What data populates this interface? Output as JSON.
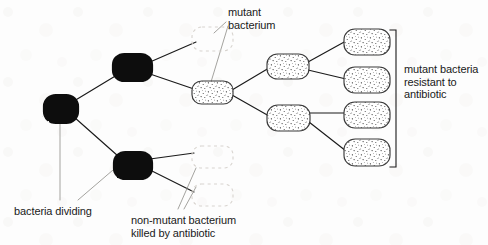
{
  "diagram": {
    "colors": {
      "ink": "#111111",
      "dead_cell_outline": "#d8d4cf",
      "stipple_outline": "#3a3a3a",
      "background": "#fdfdfd",
      "line": "#1a1a1a"
    },
    "labels": [
      {
        "id": "mutant-bacterium",
        "text": "mutant\nbacterium",
        "x": 228,
        "y": 6,
        "align": "left"
      },
      {
        "id": "mutant-bacteria-resistant",
        "text": "mutant bacteria\nresistant to\nantibiotic",
        "x": 404,
        "y": 63,
        "align": "left"
      },
      {
        "id": "bacteria-dividing",
        "text": "bacteria dividing",
        "x": 14,
        "y": 205,
        "align": "left"
      },
      {
        "id": "non-mutant-killed",
        "text": "non-mutant bacterium\nkilled by antibiotic",
        "x": 131,
        "y": 214,
        "align": "left"
      }
    ],
    "cells": [
      {
        "id": "founder-cell",
        "kind": "black",
        "x": 44,
        "y": 95,
        "w": 34,
        "h": 28
      },
      {
        "id": "gen2-upper-cell",
        "kind": "black",
        "x": 113,
        "y": 54,
        "w": 39,
        "h": 27
      },
      {
        "id": "gen2-lower-cell",
        "kind": "black",
        "x": 114,
        "y": 152,
        "w": 38,
        "h": 27
      },
      {
        "id": "gen3-dead-upper-cell",
        "kind": "dead",
        "x": 192,
        "y": 27,
        "w": 41,
        "h": 24
      },
      {
        "id": "gen3-mutant-cell",
        "kind": "stipple",
        "x": 192,
        "y": 81,
        "w": 41,
        "h": 23
      },
      {
        "id": "gen3-dead-mid-cell",
        "kind": "dead",
        "x": 192,
        "y": 146,
        "w": 41,
        "h": 22
      },
      {
        "id": "gen3-dead-lower-cell",
        "kind": "dead",
        "x": 192,
        "y": 184,
        "w": 41,
        "h": 22
      },
      {
        "id": "gen4-mutant-upper-cell",
        "kind": "stipple",
        "x": 267,
        "y": 54,
        "w": 42,
        "h": 25
      },
      {
        "id": "gen4-mutant-lower-cell",
        "kind": "stipple",
        "x": 267,
        "y": 105,
        "w": 43,
        "h": 26
      },
      {
        "id": "gen5-mutant-cell-1",
        "kind": "stipple",
        "x": 344,
        "y": 29,
        "w": 46,
        "h": 26
      },
      {
        "id": "gen5-mutant-cell-2",
        "kind": "stipple",
        "x": 344,
        "y": 67,
        "w": 46,
        "h": 26
      },
      {
        "id": "gen5-mutant-cell-3",
        "kind": "stipple",
        "x": 344,
        "y": 102,
        "w": 46,
        "h": 26
      },
      {
        "id": "gen5-mutant-cell-4",
        "kind": "stipple",
        "x": 344,
        "y": 139,
        "w": 46,
        "h": 27
      }
    ],
    "division_lines": [
      {
        "id": "founder-to-gen2-upper",
        "x1": 74,
        "y1": 101,
        "x2": 117,
        "y2": 75
      },
      {
        "id": "founder-to-gen2-lower",
        "x1": 74,
        "y1": 117,
        "x2": 118,
        "y2": 156
      },
      {
        "id": "gen2upper-to-dead",
        "x1": 150,
        "y1": 62,
        "x2": 196,
        "y2": 42
      },
      {
        "id": "gen2upper-to-mutant",
        "x1": 150,
        "y1": 74,
        "x2": 194,
        "y2": 89
      },
      {
        "id": "gen2lower-to-dead-mid",
        "x1": 150,
        "y1": 159,
        "x2": 194,
        "y2": 153
      },
      {
        "id": "gen2lower-to-dead-low",
        "x1": 150,
        "y1": 170,
        "x2": 194,
        "y2": 192
      },
      {
        "id": "mutant-to-gen4-upper",
        "x1": 232,
        "y1": 90,
        "x2": 269,
        "y2": 68
      },
      {
        "id": "mutant-to-gen4-lower",
        "x1": 232,
        "y1": 95,
        "x2": 269,
        "y2": 116
      },
      {
        "id": "gen4upper-to-cell1",
        "x1": 308,
        "y1": 62,
        "x2": 346,
        "y2": 41
      },
      {
        "id": "gen4upper-to-cell2",
        "x1": 308,
        "y1": 70,
        "x2": 346,
        "y2": 79
      },
      {
        "id": "gen4lower-to-cell3",
        "x1": 309,
        "y1": 113,
        "x2": 346,
        "y2": 113
      },
      {
        "id": "gen4lower-to-cell4",
        "x1": 309,
        "y1": 122,
        "x2": 346,
        "y2": 151
      }
    ],
    "leader_lines": [
      {
        "id": "leader-mutant-bacterium-dead",
        "x1": 226,
        "y1": 22,
        "x2": 214,
        "y2": 33
      },
      {
        "id": "leader-mutant-bacterium-cell",
        "x1": 228,
        "y1": 26,
        "x2": 211,
        "y2": 82
      },
      {
        "id": "leader-bacteria-dividing-1",
        "x1": 60,
        "y1": 123,
        "x2": 60,
        "y2": 200
      },
      {
        "id": "leader-bacteria-dividing-2",
        "x1": 113,
        "y1": 170,
        "x2": 78,
        "y2": 200
      },
      {
        "id": "leader-non-mutant-1",
        "x1": 196,
        "y1": 168,
        "x2": 178,
        "y2": 209
      },
      {
        "id": "leader-non-mutant-2",
        "x1": 196,
        "y1": 187,
        "x2": 184,
        "y2": 209
      }
    ],
    "bracket": {
      "id": "resistant-bracket",
      "x": 396,
      "y_top": 30,
      "y_bottom": 167,
      "tick": 6
    }
  }
}
